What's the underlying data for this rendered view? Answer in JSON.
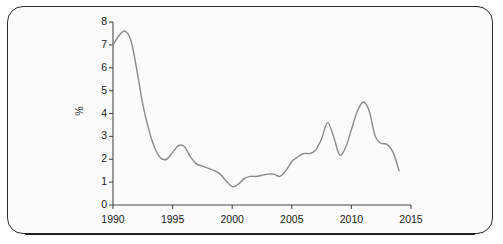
{
  "figure": {
    "frame_border_color": "#2b2b2b",
    "background_color": "#fbfbfb",
    "rule_color": "#1f1f1f"
  },
  "axis": {
    "y_title": "%",
    "y_ticks": [
      "0",
      "1",
      "2",
      "3",
      "4",
      "5",
      "6",
      "7",
      "8"
    ],
    "x_ticks": [
      "1990",
      "1995",
      "2000",
      "2005",
      "2010",
      "2015"
    ]
  },
  "chart_data": {
    "type": "line",
    "title": "",
    "xlabel": "",
    "ylabel": "%",
    "xlim": [
      1990,
      2015
    ],
    "ylim": [
      0,
      8
    ],
    "grid": false,
    "legend": "none",
    "line_color": "#8a8a8a",
    "line_width": 1.4,
    "x": [
      1990.0,
      1990.5,
      1991.0,
      1991.5,
      1992.0,
      1992.5,
      1993.0,
      1993.5,
      1994.0,
      1994.5,
      1995.0,
      1995.5,
      1996.0,
      1996.5,
      1997.0,
      1997.5,
      1998.0,
      1998.5,
      1999.0,
      1999.5,
      2000.0,
      2000.5,
      2001.0,
      2001.5,
      2002.0,
      2002.5,
      2003.0,
      2003.5,
      2004.0,
      2004.5,
      2005.0,
      2005.5,
      2006.0,
      2006.5,
      2007.0,
      2007.5,
      2008.0,
      2008.5,
      2009.0,
      2009.5,
      2010.0,
      2010.5,
      2011.0,
      2011.5,
      2012.0,
      2012.5,
      2013.0,
      2013.5,
      2014.0
    ],
    "y": [
      7.0,
      7.4,
      7.6,
      7.2,
      5.9,
      4.4,
      3.3,
      2.5,
      2.05,
      2.0,
      2.3,
      2.6,
      2.55,
      2.1,
      1.8,
      1.7,
      1.6,
      1.5,
      1.35,
      1.05,
      0.8,
      0.9,
      1.15,
      1.25,
      1.25,
      1.3,
      1.35,
      1.35,
      1.25,
      1.5,
      1.9,
      2.1,
      2.25,
      2.25,
      2.4,
      2.9,
      3.6,
      3.0,
      2.2,
      2.5,
      3.3,
      4.1,
      4.5,
      4.1,
      3.0,
      2.7,
      2.65,
      2.3,
      1.5
    ],
    "series": [
      {
        "name": "rate",
        "values": [
          7.0,
          7.4,
          7.6,
          7.2,
          5.9,
          4.4,
          3.3,
          2.5,
          2.05,
          2.0,
          2.3,
          2.6,
          2.55,
          2.1,
          1.8,
          1.7,
          1.6,
          1.5,
          1.35,
          1.05,
          0.8,
          0.9,
          1.15,
          1.25,
          1.25,
          1.3,
          1.35,
          1.35,
          1.25,
          1.5,
          1.9,
          2.1,
          2.25,
          2.25,
          2.4,
          2.9,
          3.6,
          3.0,
          2.2,
          2.5,
          3.3,
          4.1,
          4.5,
          4.1,
          3.0,
          2.7,
          2.65,
          2.3,
          1.5
        ]
      }
    ],
    "annotations": []
  }
}
